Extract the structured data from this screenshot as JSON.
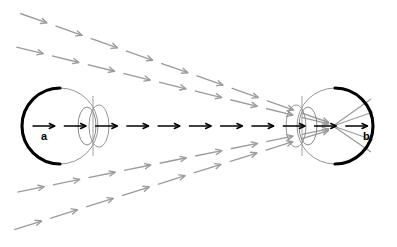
{
  "figure": {
    "width": 397,
    "height": 247,
    "background_color": "#ffffff"
  },
  "colors": {
    "ray_gray": "#9b9b9b",
    "axis_black": "#000000",
    "eye_outline": "#8a8a8a",
    "retina_black": "#000000"
  },
  "labels": [
    {
      "id": "a",
      "text": "a",
      "x": 41,
      "y": 140,
      "belongs_to": "left-eye"
    },
    {
      "id": "b",
      "text": "b",
      "x": 363,
      "y": 140,
      "belongs_to": "right-eye"
    }
  ],
  "eyes": [
    {
      "id": "left-eye",
      "name": "left-eye",
      "cx": 60,
      "cy": 126,
      "rx": 38,
      "ry": 38,
      "orientation": "facing-right",
      "retina_side": "left",
      "lens": {
        "cx": 87,
        "cy": 126,
        "rx": 9,
        "ry": 19
      },
      "cornea": {
        "cx": 99,
        "cy": 126,
        "rx": 10,
        "ry": 21
      },
      "iris_line_x": 93
    },
    {
      "id": "right-eye",
      "name": "right-eye",
      "cx": 335,
      "cy": 126,
      "rx": 38,
      "ry": 38,
      "orientation": "facing-left",
      "retina_side": "right",
      "lens": {
        "cx": 308,
        "cy": 126,
        "rx": 9,
        "ry": 19
      },
      "cornea": {
        "cx": 296,
        "cy": 126,
        "rx": 10,
        "ry": 21
      },
      "iris_line_x": 302
    }
  ],
  "axial_ray": {
    "name": "optical-axis-ray",
    "color": "#000000",
    "start_x": 28,
    "end_x": 372,
    "y": 126,
    "style": "dashed-with-arrowheads",
    "arrow_count": 11,
    "arrow_x_positions": [
      50,
      78,
      104,
      130,
      156,
      182,
      208,
      234,
      260,
      300,
      326,
      352
    ],
    "segment_length": 20,
    "head_size": 6
  },
  "ray_bundles": [
    {
      "name": "ray-top-1",
      "start": {
        "x": 16,
        "y": 12
      },
      "end": {
        "x": 333,
        "y": 124
      },
      "arrow_count": 9,
      "color": "#9b9b9b"
    },
    {
      "name": "ray-top-2",
      "start": {
        "x": 12,
        "y": 46
      },
      "end": {
        "x": 333,
        "y": 125
      },
      "arrow_count": 9,
      "color": "#9b9b9b"
    },
    {
      "name": "ray-bottom-1",
      "start": {
        "x": 13,
        "y": 193
      },
      "end": {
        "x": 333,
        "y": 128
      },
      "arrow_count": 9,
      "color": "#9b9b9b"
    },
    {
      "name": "ray-bottom-2",
      "start": {
        "x": 10,
        "y": 231
      },
      "end": {
        "x": 333,
        "y": 129
      },
      "arrow_count": 9,
      "color": "#9b9b9b"
    }
  ],
  "convergence": {
    "name": "focal-crossing-point",
    "x": 333,
    "y": 126,
    "note": "Rays cross near the right eye lens and diverge onto the retina",
    "exit_rays": [
      {
        "from_x": 333,
        "from_y": 126,
        "to_x": 371,
        "to_y": 99
      },
      {
        "from_x": 333,
        "from_y": 126,
        "to_x": 371,
        "to_y": 152
      },
      {
        "from_x": 333,
        "from_y": 126,
        "to_x": 373,
        "to_y": 112
      },
      {
        "from_x": 333,
        "from_y": 126,
        "to_x": 373,
        "to_y": 140
      }
    ]
  }
}
